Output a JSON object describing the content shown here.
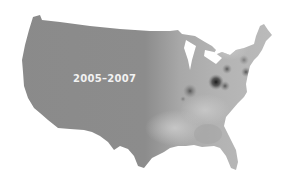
{
  "map": {
    "title": "",
    "region": "Contiguous United States",
    "period_label": "2005–2007",
    "style": "grayscale density heat map",
    "colors": {
      "background": "#ffffff",
      "base_fill": "#8a8a8a",
      "light_east": "#b8b8b8",
      "hotspot_dark": "#1e1e1e",
      "label": "#f2f2f2"
    },
    "hotspots": [
      {
        "name": "Ohio-area hotspot",
        "cx": 216,
        "cy": 82,
        "r": 7,
        "intensity": "darkest"
      },
      {
        "name": "Indiana/Illinois hotspot",
        "cx": 190,
        "cy": 91,
        "r": 6,
        "intensity": "dark"
      },
      {
        "name": "Northern Ohio hotspot",
        "cx": 227,
        "cy": 69,
        "r": 4,
        "intensity": "medium"
      },
      {
        "name": "West Virginia hotspot",
        "cx": 225,
        "cy": 86,
        "r": 4,
        "intensity": "medium"
      },
      {
        "name": "Pennsylvania/NJ hotspot",
        "cx": 246,
        "cy": 72,
        "r": 4,
        "intensity": "medium"
      },
      {
        "name": "Upstate NY hotspot",
        "cx": 244,
        "cy": 60,
        "r": 4,
        "intensity": "light"
      }
    ]
  }
}
